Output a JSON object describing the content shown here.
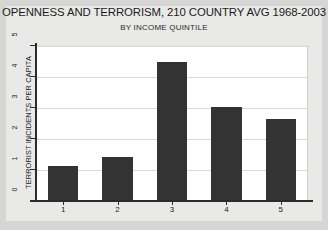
{
  "chart_data": {
    "type": "bar",
    "title": "OPENNESS AND TERRORISM, 210 COUNTRY AVG 1968-2003",
    "subtitle": "BY INCOME QUINTILE",
    "xlabel": "",
    "ylabel": "TERRORIST INCIDENTS PER CAPITA",
    "categories": [
      "1",
      "2",
      "3",
      "4",
      "5"
    ],
    "values": [
      1.1,
      1.4,
      4.45,
      3.0,
      2.6
    ],
    "ylim": [
      0,
      5
    ],
    "yticks": [
      "0",
      "1",
      "2",
      "3",
      "4",
      "5"
    ],
    "grid": true,
    "legend": "none",
    "bar_color": "#333333",
    "plot_background": "#ffffff",
    "figure_background": "#d6d6d4",
    "panel_background": "#e9e9e7",
    "axis_color": "#2b2b2b",
    "gridline_color": "#d9d9d7"
  }
}
